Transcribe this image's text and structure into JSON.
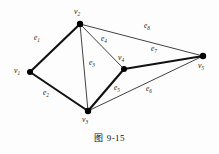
{
  "figure": {
    "caption_prefix": "图",
    "caption_number": "9-15",
    "caption_full": "图 9-15"
  },
  "diagram": {
    "type": "undirected-graph",
    "background_color": "#fdfdfd",
    "stroke_color": "#111111",
    "vertex_color": "#000000",
    "vertices": [
      {
        "id": "v1",
        "label": "v",
        "sub": "1",
        "x": 30,
        "y": 72,
        "label_x": 14,
        "label_y": 67,
        "radius": 3.0
      },
      {
        "id": "v2",
        "label": "v",
        "sub": "2",
        "x": 80,
        "y": 24,
        "label_x": 74,
        "label_y": 8,
        "radius": 3.2
      },
      {
        "id": "v3",
        "label": "v",
        "sub": "3",
        "x": 88,
        "y": 111,
        "label_x": 82,
        "label_y": 116,
        "radius": 3.2
      },
      {
        "id": "v4",
        "label": "v",
        "sub": "4",
        "x": 124,
        "y": 69,
        "label_x": 118,
        "label_y": 54,
        "radius": 3.0
      },
      {
        "id": "v5",
        "label": "v",
        "sub": "5",
        "x": 203,
        "y": 56,
        "label_x": 198,
        "label_y": 62,
        "radius": 3.2
      }
    ],
    "edges": [
      {
        "id": "e1",
        "label": "e",
        "sub": "1",
        "from": "v1",
        "to": "v2",
        "weight": "thick",
        "width": 2.1,
        "label_x": 34,
        "label_y": 34
      },
      {
        "id": "e2",
        "label": "e",
        "sub": "2",
        "from": "v1",
        "to": "v3",
        "weight": "thick",
        "width": 2.1,
        "label_x": 43,
        "label_y": 89
      },
      {
        "id": "e3",
        "label": "e",
        "sub": "3",
        "from": "v2",
        "to": "v3",
        "weight": "thin",
        "width": 0.8,
        "label_x": 89,
        "label_y": 59
      },
      {
        "id": "e4",
        "label": "e",
        "sub": "4",
        "from": "v2",
        "to": "v4",
        "weight": "thin",
        "width": 0.8,
        "label_x": 101,
        "label_y": 35
      },
      {
        "id": "e5",
        "label": "e",
        "sub": "5",
        "from": "v3",
        "to": "v4",
        "weight": "thick",
        "width": 2.1,
        "label_x": 114,
        "label_y": 84
      },
      {
        "id": "e6",
        "label": "e",
        "sub": "6",
        "from": "v3",
        "to": "v5",
        "weight": "thin",
        "width": 0.8,
        "label_x": 146,
        "label_y": 85
      },
      {
        "id": "e7",
        "label": "e",
        "sub": "7",
        "from": "v4",
        "to": "v5",
        "weight": "thick",
        "width": 2.1,
        "label_x": 151,
        "label_y": 45
      },
      {
        "id": "e8",
        "label": "e",
        "sub": "8",
        "from": "v2",
        "to": "v5",
        "weight": "thin",
        "width": 0.8,
        "label_x": 144,
        "label_y": 22
      }
    ]
  }
}
